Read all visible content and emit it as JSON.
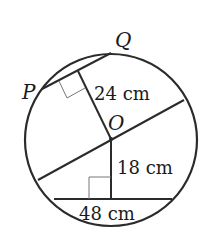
{
  "diagram": {
    "type": "circle-chord-geometry",
    "points": {
      "P": "P",
      "Q": "Q",
      "O": "O"
    },
    "measurements": {
      "op_distance": "24 cm",
      "bottom_distance": "18 cm",
      "bottom_chord": "48 cm"
    },
    "colors": {
      "stroke": "#2b2b2b",
      "right_angle": "#777777",
      "background": "#ffffff"
    }
  }
}
